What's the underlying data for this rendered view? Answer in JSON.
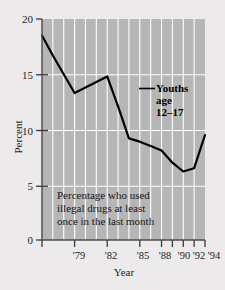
{
  "figure": {
    "background_color": "#eceaea",
    "plot_background_color": "#b6b6b6",
    "gridline_color": "#ffffff",
    "line_color": "#000000",
    "axis_color": "#3a3a3a"
  },
  "chart_data": {
    "type": "line",
    "title": "",
    "subtitle": "",
    "xlabel": "Year",
    "ylabel": "Percent",
    "ylim": [
      0,
      20
    ],
    "xlim": [
      1979,
      1994
    ],
    "yticks": [
      0,
      5,
      10,
      15,
      20
    ],
    "ytick_labels": [
      "0",
      "5",
      "10",
      "15",
      "20"
    ],
    "xticks": [
      1979,
      1982,
      1985,
      1988,
      1990,
      1991,
      1992,
      1993,
      1994
    ],
    "xtick_labels": [
      "'79",
      "'82",
      "'85",
      "'88",
      "'90",
      "'92",
      "'94"
    ],
    "xtick_label_years": [
      1979,
      1982,
      1985,
      1988,
      1990,
      1992,
      1994
    ],
    "grid": true,
    "grid_axis": "both",
    "legend_position": "inline-annotation",
    "x": [
      1979,
      1980,
      1981,
      1982,
      1983,
      1984,
      1985,
      1986,
      1987,
      1988,
      1989,
      1990,
      1991,
      1992,
      1993,
      1994
    ],
    "series": [
      {
        "name": "Youths age 12–17",
        "values": [
          18.5,
          16.7,
          15.0,
          13.3,
          13.8,
          14.3,
          14.8,
          12.1,
          9.2,
          8.9,
          8.5,
          8.1,
          7.0,
          6.2,
          6.5,
          9.5
        ]
      }
    ],
    "annotations": [
      {
        "name": "series-label",
        "lines": [
          "Youths",
          "age",
          "12–17"
        ],
        "bold": true
      },
      {
        "name": "caption",
        "lines": [
          "Percentage who used",
          "illegal drugs at least",
          "once in the last month"
        ],
        "bold": false
      }
    ]
  },
  "labels": {
    "y_axis_title": "Percent",
    "x_axis_title": "Year",
    "ytick_0": "0",
    "ytick_5": "5",
    "ytick_10": "10",
    "ytick_15": "15",
    "ytick_20": "20",
    "xtick_79": "'79",
    "xtick_82": "'82",
    "xtick_85": "'85",
    "xtick_88": "'88",
    "xtick_90": "'90",
    "xtick_92": "'92",
    "xtick_94": "'94",
    "annot_line_1": "Youths",
    "annot_line_2": "age",
    "annot_line_3": "12–17",
    "caption_line_1": "Percentage who used",
    "caption_line_2": "illegal drugs at least",
    "caption_line_3": "once in the last month"
  }
}
